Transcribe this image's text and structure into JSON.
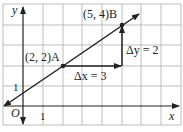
{
  "diagram": {
    "type": "coordinate-grid-slope",
    "axes": {
      "x_label": "x",
      "y_label": "y",
      "origin_label": "O",
      "x_tick_label": "1",
      "y_tick_label": "1"
    },
    "points": [
      {
        "name": "A",
        "coords": [
          2,
          2
        ],
        "label": "(2, 2)A"
      },
      {
        "name": "B",
        "coords": [
          5,
          4
        ],
        "label": "(5, 4)B"
      }
    ],
    "line": {
      "through": [
        "A",
        "B"
      ],
      "slope": "2/3"
    },
    "annotations": {
      "delta_x": "Δx = 3",
      "delta_y": "Δy = 2"
    },
    "grid": {
      "x_range": [
        -1,
        8
      ],
      "y_range": [
        -1,
        5
      ]
    },
    "colors": {
      "grid": "#bdbdbd",
      "ink": "#222222"
    }
  }
}
